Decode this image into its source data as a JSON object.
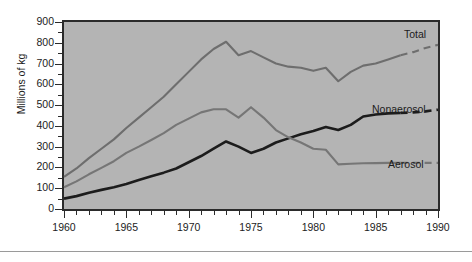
{
  "chart_data": {
    "type": "line",
    "title": "",
    "subtitle": "",
    "xlabel": "",
    "ylabel": "Millions of kg",
    "xlim": [
      1960,
      1990
    ],
    "ylim": [
      0,
      900
    ],
    "grid": false,
    "legend_position": "inline-right",
    "background_color": "#b4b4b4",
    "x_major_ticks": [
      1960,
      1965,
      1970,
      1975,
      1980,
      1985,
      1990
    ],
    "x_major_tick_labels": [
      "1960",
      "1965",
      "1970",
      "1975",
      "1980",
      "1985",
      "1990"
    ],
    "x_minor_tick_interval": 1,
    "y_major_ticks": [
      0,
      100,
      200,
      300,
      400,
      500,
      600,
      700,
      800,
      900
    ],
    "y_major_tick_labels": [
      "0",
      "100",
      "200",
      "300",
      "400",
      "500",
      "600",
      "700",
      "800",
      "900"
    ],
    "y_minor_tick_interval": 50,
    "x": [
      1960,
      1961,
      1962,
      1963,
      1964,
      1965,
      1966,
      1967,
      1968,
      1969,
      1970,
      1971,
      1972,
      1973,
      1974,
      1975,
      1976,
      1977,
      1978,
      1979,
      1980,
      1981,
      1982,
      1983,
      1984,
      1985,
      1986,
      1987,
      1988,
      1989,
      1990
    ],
    "projection_starts_at": 1987,
    "series": [
      {
        "name": "Total",
        "color": "#6e6e6e",
        "line_width": 2.1,
        "label": "Total",
        "values": [
          155,
          195,
          245,
          290,
          335,
          390,
          440,
          490,
          540,
          600,
          660,
          720,
          770,
          805,
          740,
          760,
          730,
          700,
          685,
          680,
          665,
          680,
          615,
          660,
          690,
          700,
          720,
          740,
          755,
          775,
          790
        ]
      },
      {
        "name": "Nonaerosol",
        "color": "#1c1c1c",
        "line_width": 2.6,
        "label": "Nonaerosol",
        "values": [
          50,
          62,
          78,
          92,
          105,
          120,
          140,
          158,
          175,
          195,
          225,
          255,
          290,
          325,
          300,
          270,
          290,
          320,
          340,
          360,
          375,
          395,
          380,
          405,
          445,
          455,
          460,
          462,
          465,
          470,
          478
        ]
      },
      {
        "name": "Aerosol",
        "color": "#767676",
        "line_width": 2.1,
        "label": "Aerosol",
        "values": [
          105,
          133,
          167,
          198,
          230,
          270,
          300,
          332,
          365,
          405,
          435,
          465,
          480,
          480,
          440,
          490,
          440,
          380,
          345,
          320,
          290,
          285,
          215,
          218,
          220,
          221,
          222,
          222,
          222,
          222,
          222
        ]
      }
    ]
  }
}
